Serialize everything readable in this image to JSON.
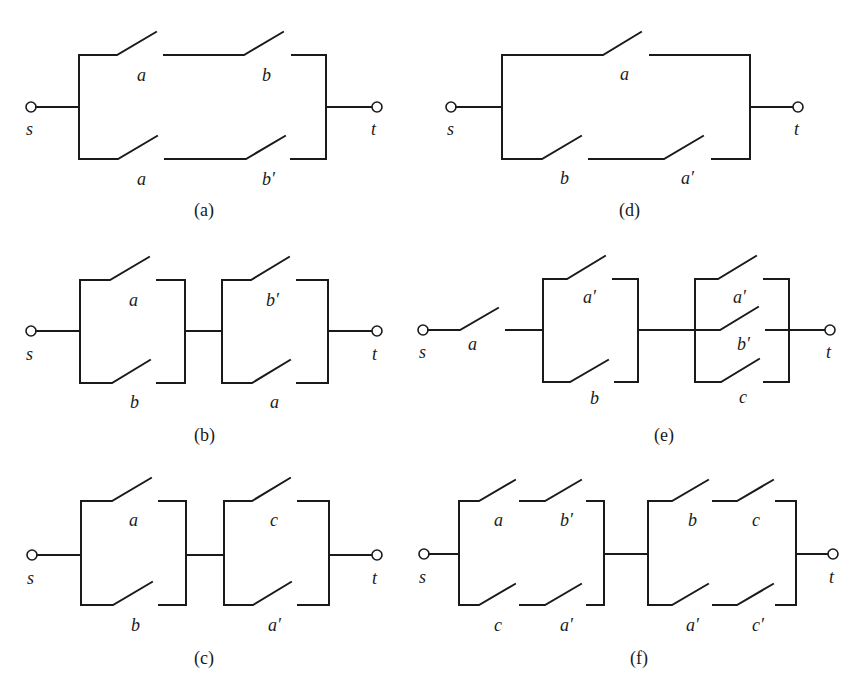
{
  "figure": {
    "background": "#ffffff",
    "ink": "#1a1a1a",
    "circuits": [
      {
        "caption": "(a)",
        "source": "s",
        "sink": "t",
        "structure": "parallel of two series branches",
        "branches": [
          [
            "a",
            "b"
          ],
          [
            "a",
            "b′"
          ]
        ]
      },
      {
        "caption": "(b)",
        "source": "s",
        "sink": "t",
        "structure": "series of two parallel blocks",
        "blocks": [
          [
            "a",
            "b"
          ],
          [
            "b′",
            "a"
          ]
        ]
      },
      {
        "caption": "(c)",
        "source": "s",
        "sink": "t",
        "structure": "series of two parallel blocks",
        "blocks": [
          [
            "a",
            "b"
          ],
          [
            "c",
            "a′"
          ]
        ]
      },
      {
        "caption": "(d)",
        "source": "s",
        "sink": "t",
        "structure": "parallel of single switch and series branch",
        "branches": [
          [
            "a"
          ],
          [
            "b",
            "a′"
          ]
        ]
      },
      {
        "caption": "(e)",
        "source": "s",
        "sink": "t",
        "structure": "series switch, then two parallel blocks",
        "lead_switch": "a",
        "blocks": [
          [
            "a′",
            "b"
          ],
          [
            "a′",
            "b′",
            "c"
          ]
        ]
      },
      {
        "caption": "(f)",
        "source": "s",
        "sink": "t",
        "structure": "series of two parallel blocks, each with two series branches",
        "blocks": [
          [
            [
              "a",
              "b′"
            ],
            [
              "c",
              "a′"
            ]
          ],
          [
            [
              "b",
              "c"
            ],
            [
              "a′",
              "c′"
            ]
          ]
        ]
      }
    ]
  }
}
